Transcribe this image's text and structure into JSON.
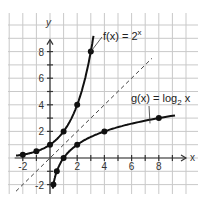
{
  "chart_data": {
    "type": "line",
    "title": "",
    "xlabel": "x",
    "ylabel": "y",
    "xlim": [
      -2,
      9
    ],
    "ylim": [
      -2,
      9
    ],
    "grid": true,
    "x_ticks": [
      "-2",
      "2",
      "4",
      "6",
      "8"
    ],
    "y_ticks": [
      "-2",
      "2",
      "4",
      "6",
      "8"
    ],
    "series": [
      {
        "name": "f(x) = 2^x",
        "label": "f(x) = 2",
        "exponent": "x",
        "points": [
          [
            -2,
            0.25
          ],
          [
            -1,
            0.5
          ],
          [
            0,
            1
          ],
          [
            1,
            2
          ],
          [
            2,
            4
          ],
          [
            3,
            8
          ]
        ]
      },
      {
        "name": "g(x) = log2 x",
        "label": "g(x) = log",
        "subscript": "2",
        "suffix": " x",
        "points": [
          [
            0.25,
            -2
          ],
          [
            0.5,
            -1
          ],
          [
            1,
            0
          ],
          [
            2,
            1
          ],
          [
            4,
            2
          ],
          [
            8,
            3
          ]
        ]
      },
      {
        "name": "y = x",
        "style": "dashed",
        "points": [
          [
            -2.5,
            -2.5
          ],
          [
            7.5,
            7.5
          ]
        ]
      }
    ]
  }
}
